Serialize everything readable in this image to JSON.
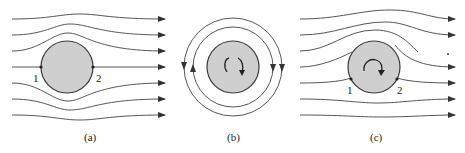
{
  "figure": {
    "colors": {
      "line": "#333333",
      "cylinder_fill": "#cfcfcf",
      "cylinder_stroke": "#3a3a3a",
      "background": "#ffffff"
    },
    "panels": [
      {
        "id": "a",
        "caption": "(a)",
        "point_labels": [
          "1",
          "2"
        ],
        "rotation": "none"
      },
      {
        "id": "b",
        "caption": "(b)",
        "point_labels": [],
        "rotation": "clockwise"
      },
      {
        "id": "c",
        "caption": "(c)",
        "point_labels": [
          "1",
          "2"
        ],
        "rotation": "clockwise"
      }
    ]
  }
}
